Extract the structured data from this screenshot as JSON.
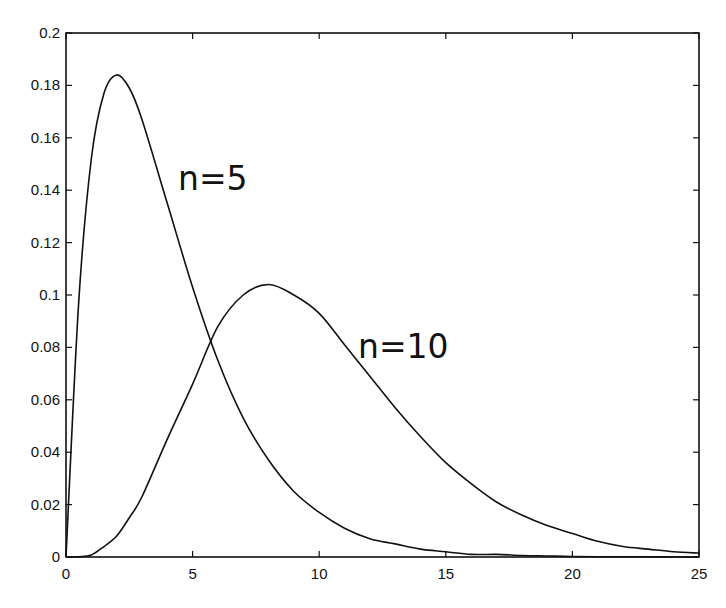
{
  "chart_data": {
    "type": "line",
    "title": "",
    "xlabel": "",
    "ylabel": "",
    "xlim": [
      0,
      25
    ],
    "ylim": [
      0,
      0.2
    ],
    "grid": false,
    "legend": null,
    "x_ticks": [
      "0",
      "5",
      "10",
      "15",
      "20",
      "25"
    ],
    "y_ticks": [
      "0",
      "0.02",
      "0.04",
      "0.06",
      "0.08",
      "0.1",
      "0.12",
      "0.14",
      "0.16",
      "0.18",
      "0.2"
    ],
    "annotations": [
      {
        "text": "n=5",
        "x": 4.4,
        "y": 0.14
      },
      {
        "text": "n=10",
        "x": 11.7,
        "y": 0.078
      }
    ],
    "x": [
      0,
      0.5,
      1,
      1.5,
      2,
      2.5,
      3,
      4,
      5,
      6,
      7,
      8,
      9,
      10,
      11,
      12,
      13,
      14,
      15,
      16,
      17,
      18,
      19,
      20,
      21,
      22,
      23,
      24,
      25
    ],
    "series": [
      {
        "name": "n=5",
        "values": [
          0,
          0.097,
          0.152,
          0.177,
          0.184,
          0.179,
          0.167,
          0.135,
          0.103,
          0.075,
          0.053,
          0.037,
          0.025,
          0.017,
          0.011,
          0.007,
          0.005,
          0.003,
          0.002,
          0.001,
          0.001,
          0.0006,
          0.0004,
          0.0002,
          0.0001,
          0.0001,
          0.0001,
          0,
          0
        ]
      },
      {
        "name": "n=10",
        "values": [
          0,
          0.0001,
          0.0008,
          0.004,
          0.008,
          0.015,
          0.023,
          0.045,
          0.066,
          0.088,
          0.1,
          0.104,
          0.1,
          0.093,
          0.081,
          0.069,
          0.057,
          0.046,
          0.036,
          0.028,
          0.021,
          0.016,
          0.012,
          0.009,
          0.006,
          0.004,
          0.003,
          0.002,
          0.0015
        ]
      }
    ]
  }
}
